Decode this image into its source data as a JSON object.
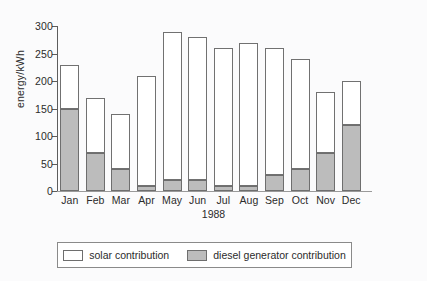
{
  "chart_data": {
    "type": "bar",
    "title": "",
    "xlabel": "1988",
    "ylabel": "energy/kWh",
    "ylim": [
      0,
      300
    ],
    "yticks": [
      0,
      50,
      100,
      150,
      200,
      250,
      300
    ],
    "grid": false,
    "stacked": true,
    "legend_position": "bottom",
    "categories": [
      "Jan",
      "Feb",
      "Mar",
      "Apr",
      "May",
      "Jun",
      "Jul",
      "Aug",
      "Sep",
      "Oct",
      "Nov",
      "Dec"
    ],
    "series": [
      {
        "name": "diesel generator contribution",
        "color": "#bcbcbc",
        "values": [
          150,
          70,
          40,
          10,
          20,
          20,
          10,
          10,
          30,
          40,
          70,
          120
        ]
      },
      {
        "name": "solar contribution",
        "color": "#ffffff",
        "values": [
          80,
          100,
          100,
          200,
          270,
          260,
          250,
          260,
          230,
          200,
          110,
          80
        ]
      }
    ],
    "totals": [
      230,
      170,
      140,
      210,
      290,
      280,
      260,
      270,
      260,
      240,
      180,
      200
    ]
  },
  "legend": {
    "entries": [
      {
        "label": "solar contribution",
        "swatch": "white-square-icon"
      },
      {
        "label": "diesel generator contribution",
        "swatch": "grey-square-icon"
      }
    ]
  }
}
